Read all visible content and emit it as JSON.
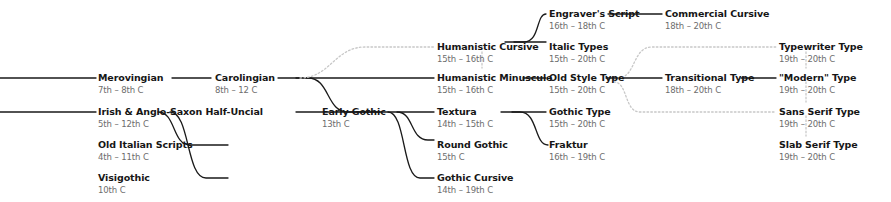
{
  "diagram": {
    "background_color": "#ffffff",
    "solid_edge_color": "#1a1a1a",
    "dotted_edge_color": "#c8c8c8",
    "name_color": "#161616",
    "date_color": "#6d6d6d"
  },
  "nodes": [
    {
      "id": "merovingian",
      "name": "Merovingian",
      "date": "7th – 8th C",
      "x": 98,
      "y": 73
    },
    {
      "id": "irish",
      "name": "Irish & Anglo-Saxon Half-Uncial",
      "date": "5th – 12th C",
      "x": 98,
      "y": 107
    },
    {
      "id": "old-italian",
      "name": "Old Italian Scripts",
      "date": "4th – 11th C",
      "x": 98,
      "y": 140
    },
    {
      "id": "visigothic",
      "name": "Visigothic",
      "date": "10th C",
      "x": 98,
      "y": 173
    },
    {
      "id": "carolingian",
      "name": "Carolingian",
      "date": "8th – 12 C",
      "x": 215,
      "y": 73
    },
    {
      "id": "early-gothic",
      "name": "Early Gothic",
      "date": "13th C",
      "x": 322,
      "y": 107
    },
    {
      "id": "humanistic-cursive",
      "name": "Humanistic Cursive",
      "date": "15th – 16th C",
      "x": 437,
      "y": 42
    },
    {
      "id": "humanistic-minuscule",
      "name": "Humanistic Minuscule",
      "date": "15th – 16th C",
      "x": 437,
      "y": 73
    },
    {
      "id": "textura",
      "name": "Textura",
      "date": "14th – 15th C",
      "x": 437,
      "y": 107
    },
    {
      "id": "round-gothic",
      "name": "Round Gothic",
      "date": "15th C",
      "x": 437,
      "y": 140
    },
    {
      "id": "gothic-cursive",
      "name": "Gothic Cursive",
      "date": "14th – 19th C",
      "x": 437,
      "y": 173
    },
    {
      "id": "engravers-script",
      "name": "Engraver's Script",
      "date": "16th – 18th C",
      "x": 549,
      "y": 9
    },
    {
      "id": "italic-types",
      "name": "Italic Types",
      "date": "15th – 20th C",
      "x": 549,
      "y": 42
    },
    {
      "id": "old-style-type",
      "name": "Old Style Type",
      "date": "15th – 20th C",
      "x": 549,
      "y": 73
    },
    {
      "id": "gothic-type",
      "name": "Gothic Type",
      "date": "15th – 20th C",
      "x": 549,
      "y": 107
    },
    {
      "id": "fraktur",
      "name": "Fraktur",
      "date": "16th – 19th C",
      "x": 549,
      "y": 140
    },
    {
      "id": "commercial-cursive",
      "name": "Commercial Cursive",
      "date": "18th – 20th C",
      "x": 665,
      "y": 9
    },
    {
      "id": "transitional-type",
      "name": "Transitional Type",
      "date": "18th – 20th C",
      "x": 665,
      "y": 73
    },
    {
      "id": "typewriter-type",
      "name": "Typewriter Type",
      "date": "19th – 20th C",
      "x": 779,
      "y": 42
    },
    {
      "id": "modern-type",
      "name": "\"Modern\" Type",
      "date": "19th – 20th C",
      "x": 779,
      "y": 73
    },
    {
      "id": "sans-serif-type",
      "name": "Sans Serif Type",
      "date": "19th – 20th C",
      "x": 779,
      "y": 107
    },
    {
      "id": "slab-serif-type",
      "name": "Slab Serif Type",
      "date": "19th – 20th C",
      "x": 779,
      "y": 140
    }
  ],
  "edges_solid": [
    "M 0,78 L 96,78",
    "M 0,112 L 96,112",
    "M 158,112 C 176,112 172,145 190,145 L 228,145",
    "M 170,112 C 190,112 186,178 206,178 L 228,178",
    "M 172,78 L 211,78",
    "M 278,78 L 308,78 C 330,78 326,112 348,112 L 380,112",
    "M 296,112 L 434,112",
    "M 296,78 L 434,78",
    "M 397,112 C 414,112 410,140 428,140 L 434,140",
    "M 388,112 C 406,112 402,178 420,178 L 434,178",
    "M 505,42 L 524,42 C 540,42 536,14 546,14",
    "M 514,42 L 546,42",
    "M 523,78 L 546,78",
    "M 501,112 L 520,112 C 538,112 534,145 548,145",
    "M 512,112 L 546,112",
    "M 608,14 L 662,14",
    "M 606,78 L 662,78",
    "M 741,78 L 776,78"
  ],
  "edges_dotted": [
    "M 300,78 C 330,78 335,47 365,47 L 434,47",
    "M 482,52 L 482,68",
    "M 618,78 C 636,78 632,47 652,47 L 670,47 L 700,47 C 730,47 726,47 744,47 L 776,47",
    "M 614,82 C 628,82 624,112 640,112 L 776,112",
    "M 806,52 L 806,68",
    "M 806,82 L 806,102",
    "M 806,116 L 806,136"
  ]
}
